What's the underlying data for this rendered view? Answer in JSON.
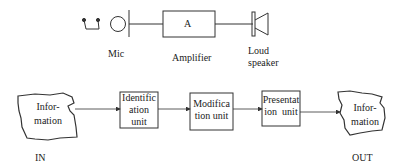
{
  "top_diagram": {
    "mic": {
      "label": "Mic"
    },
    "amplifier": {
      "symbol": "A",
      "label": "Amplifier"
    },
    "speaker": {
      "label_line1": "Loud",
      "label_line2": "speaker"
    }
  },
  "bottom_diagram": {
    "input": {
      "text_line1": "Infor-",
      "text_line2": "mation",
      "caption": "IN"
    },
    "blocks": [
      {
        "line1": "Identific",
        "line2": "ation",
        "line3": "unit"
      },
      {
        "line1": "Modifica",
        "line2": "tion unit"
      },
      {
        "line1": "Presentat",
        "line2": "ion  unit"
      }
    ],
    "output": {
      "text_line1": "Infor-",
      "text_line2": "mation",
      "caption": "OUT"
    }
  },
  "colors": {
    "stroke": "#333333",
    "background": "#ffffff"
  }
}
